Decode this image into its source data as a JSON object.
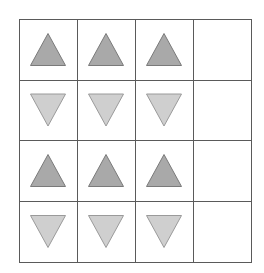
{
  "figure": {
    "type": "pattern-grid",
    "rows": 4,
    "cols": 4,
    "colors": {
      "background": "#ffffff",
      "grid_line": "#5a5a5a",
      "up_fill": "#a9a9a9",
      "up_stroke": "#7a7a7a",
      "down_fill": "#cfcfcf",
      "down_stroke": "#9a9a9a"
    },
    "cells": [
      [
        "triangle-up",
        "triangle-up",
        "triangle-up",
        "empty"
      ],
      [
        "triangle-down",
        "triangle-down",
        "triangle-down",
        "empty"
      ],
      [
        "triangle-up",
        "triangle-up",
        "triangle-up",
        "empty"
      ],
      [
        "triangle-down",
        "triangle-down",
        "triangle-down",
        "empty"
      ]
    ]
  }
}
